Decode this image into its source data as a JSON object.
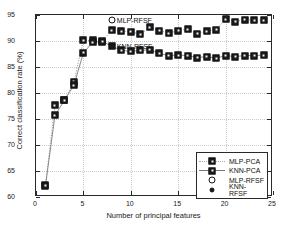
{
  "chart_data": {
    "type": "line",
    "title": "",
    "xlabel": "Number of principal features",
    "ylabel": "Correct classification rate (%)",
    "xlim": [
      0,
      25
    ],
    "ylim": [
      60,
      95
    ],
    "xticks": [
      0,
      5,
      10,
      15,
      20,
      25
    ],
    "yticks": [
      60,
      65,
      70,
      75,
      80,
      85,
      90,
      95
    ],
    "grid": true,
    "legend_position": "lower right",
    "x": [
      1,
      2,
      3,
      4,
      5,
      6,
      7,
      8,
      9,
      10,
      11,
      12,
      13,
      14,
      15,
      16,
      17,
      18,
      19,
      20,
      21,
      22,
      23,
      24
    ],
    "series": [
      {
        "name": "MLP-PCA",
        "marker": "filled-square",
        "line": "dotted",
        "values": [
          62.3,
          77.6,
          78.7,
          82.2,
          90.1,
          90.1,
          90.0,
          92.1,
          91.9,
          91.8,
          91.3,
          92.6,
          92.0,
          91.5,
          92.0,
          92.3,
          91.4,
          91.9,
          92.2,
          94.2,
          93.7,
          94.1,
          94.0,
          94.0
        ]
      },
      {
        "name": "KNN-PCA",
        "marker": "filled-square",
        "line": "solid",
        "values": [
          62.2,
          75.7,
          78.6,
          81.5,
          87.7,
          89.8,
          89.9,
          89.0,
          88.2,
          88.0,
          88.2,
          88.3,
          87.6,
          87.2,
          87.3,
          87.2,
          86.8,
          87.0,
          86.7,
          87.2,
          87.0,
          87.2,
          87.2,
          87.3
        ]
      },
      {
        "name": "MLP-RFSF",
        "marker": "open-circle",
        "line": "none",
        "points": [
          {
            "x": 8,
            "y": 94.0
          }
        ]
      },
      {
        "name": "KNN-RFSF",
        "marker": "filled-circle",
        "line": "none",
        "points": [
          {
            "x": 8,
            "y": 89.0
          }
        ]
      }
    ],
    "annotations": [
      {
        "text": "MLP-RFSF",
        "x": 8,
        "y": 94.0
      },
      {
        "text": "KNN-RFSF",
        "x": 8,
        "y": 89.0
      }
    ],
    "colors": {
      "marker": "#1c1c1c",
      "line": "#8a8a8a",
      "axis": "#2a2a2a",
      "grid": "#c9c9c9",
      "background": "#ffffff"
    }
  },
  "legend": {
    "items": [
      {
        "label": "MLP-PCA",
        "marker": "filled-square",
        "line": "dotted"
      },
      {
        "label": "KNN-PCA",
        "marker": "filled-square",
        "line": "solid"
      },
      {
        "label": "MLP-RFSF",
        "marker": "open-circle",
        "line": "none"
      },
      {
        "label": "KNN-RFSF",
        "marker": "filled-circle",
        "line": "none"
      }
    ]
  }
}
